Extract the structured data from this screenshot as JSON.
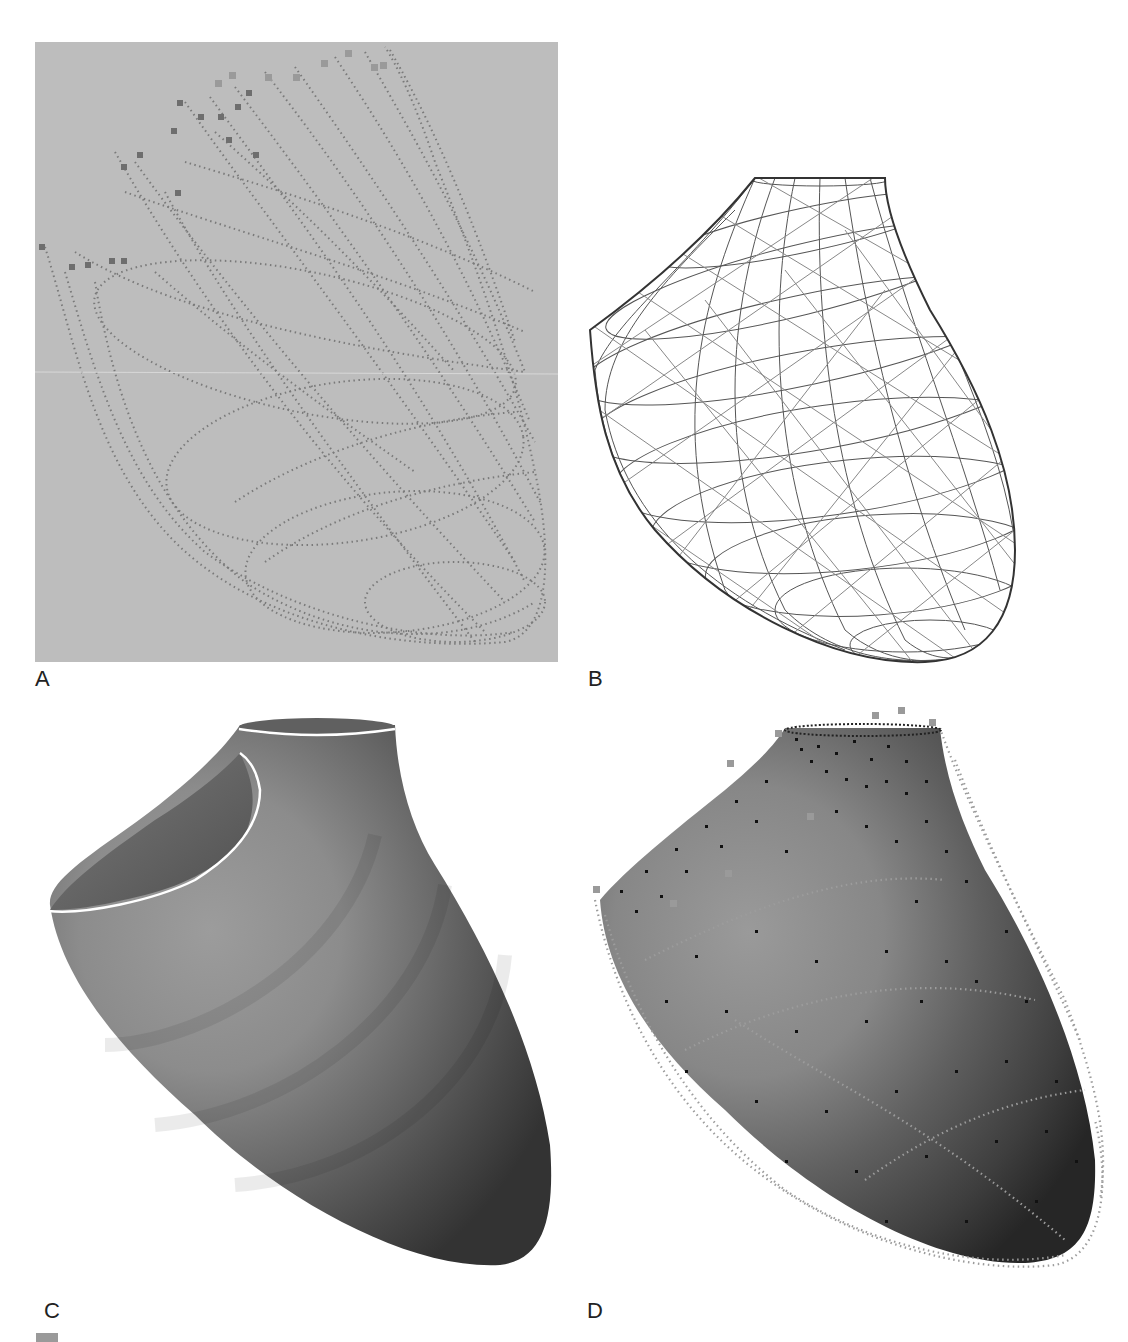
{
  "figure": {
    "panels": [
      {
        "id": "A",
        "label": "A",
        "rendering": "point-cloud trajectories",
        "background": "#bdbdbd",
        "point_color": "#7a7a7a"
      },
      {
        "id": "B",
        "label": "B",
        "rendering": "wireframe mesh",
        "background": "#ffffff",
        "line_color": "#444444"
      },
      {
        "id": "C",
        "label": "C",
        "rendering": "shaded surface",
        "background": "#ffffff",
        "surface_light": "#9a9a9a",
        "surface_dark": "#3a3a3a",
        "rim_color": "#ffffff"
      },
      {
        "id": "D",
        "label": "D",
        "rendering": "shaded surface with data points",
        "background": "#ffffff",
        "surface_light": "#9a9a9a",
        "surface_dark": "#2e2e2e",
        "node_color": "#111111",
        "trace_color": "#9c9c9c"
      }
    ]
  }
}
